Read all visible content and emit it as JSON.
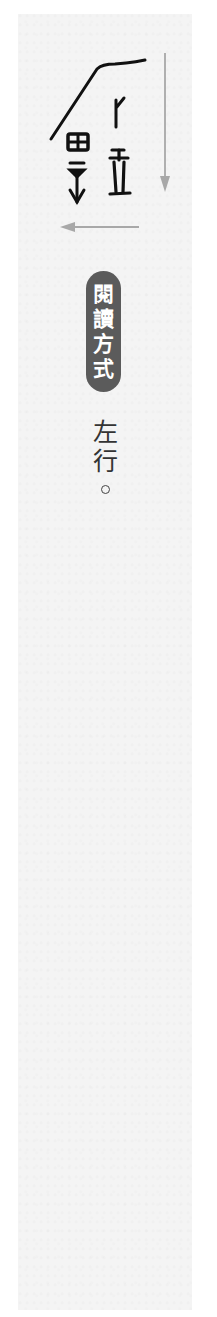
{
  "page": {
    "background": "#ffffff",
    "paper_color": "#f4f4f4"
  },
  "inscription": {
    "description": "ancient script inscription glyphs",
    "ink_color": "#111111",
    "arrow_color": "#a8a8a8",
    "arrows": [
      {
        "direction": "down",
        "label": "vertical-reading-arrow"
      },
      {
        "direction": "left",
        "label": "horizontal-reading-arrow"
      }
    ]
  },
  "badge": {
    "chars": [
      "閱",
      "讀",
      "方",
      "式"
    ],
    "background": "#5b5b5b",
    "text_color": "#ffffff"
  },
  "reading": {
    "chars": [
      "左",
      "行"
    ],
    "punctuation": "。",
    "text_color": "#333333"
  }
}
